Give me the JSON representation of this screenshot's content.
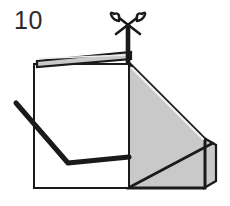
{
  "figure": {
    "step_number": "10",
    "kind": "craft-folding-instruction-diagram",
    "background_color": "#ffffff",
    "ink_color": "#1a1a1a",
    "shade_color": "#c9c9c9",
    "shade_edge_color": "#b4b4b4",
    "icons": {
      "scissors": "scissors-icon",
      "cut_line": "cut-guide-line"
    },
    "parts": {
      "front_panel_label": "front-white-panel",
      "shaded_panel_label": "shaded-side-panel",
      "top_flap_label": "top-edge-flap",
      "fold_line_label": "bent-fold-line",
      "shade_crease_label": "shaded-panel-crease"
    },
    "geometry": {
      "front_panel": "34,64 128,64 128,187 34,187",
      "top_flap": "36,61 131,53 131,60 36,66",
      "shaded_panel": "128,62 205,139 205,187 128,187",
      "shade_right_band": "205,139 216,145 216,181 205,187",
      "shade_crease": "128,187 205,139",
      "cut_line": "128,27 128,64",
      "fold_line": "16,103 68,163 128,158"
    }
  }
}
